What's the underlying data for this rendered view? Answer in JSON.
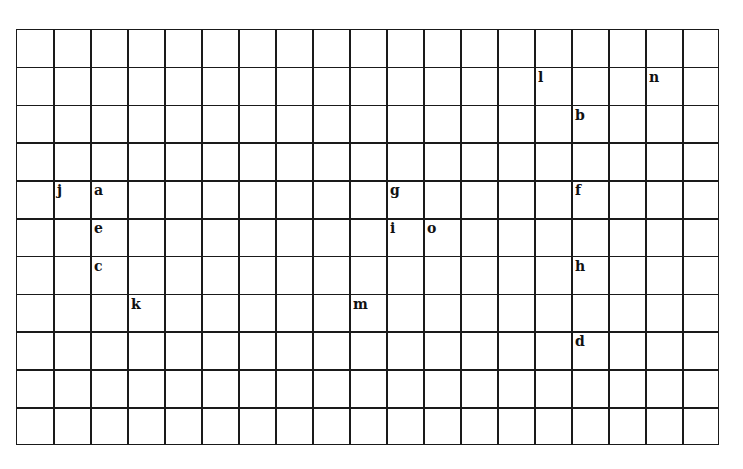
{
  "grid": {
    "columns": 19,
    "rows": 11,
    "origin_x": 16,
    "origin_y": 29,
    "col_width": 37,
    "row_height": 37.8,
    "line_color": "#1a1a1a"
  },
  "letters": [
    {
      "char": "l",
      "col": 14,
      "row": 1
    },
    {
      "char": "n",
      "col": 17,
      "row": 1
    },
    {
      "char": "b",
      "col": 15,
      "row": 2
    },
    {
      "char": "j",
      "col": 1,
      "row": 4
    },
    {
      "char": "a",
      "col": 2,
      "row": 4
    },
    {
      "char": "g",
      "col": 10,
      "row": 4
    },
    {
      "char": "f",
      "col": 15,
      "row": 4
    },
    {
      "char": "e",
      "col": 2,
      "row": 5
    },
    {
      "char": "i",
      "col": 10,
      "row": 5
    },
    {
      "char": "o",
      "col": 11,
      "row": 5
    },
    {
      "char": "c",
      "col": 2,
      "row": 6
    },
    {
      "char": "h",
      "col": 15,
      "row": 6
    },
    {
      "char": "k",
      "col": 3,
      "row": 7
    },
    {
      "char": "m",
      "col": 9,
      "row": 7
    },
    {
      "char": "d",
      "col": 15,
      "row": 8
    }
  ]
}
